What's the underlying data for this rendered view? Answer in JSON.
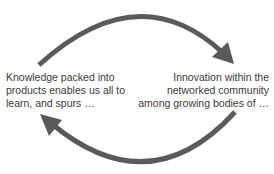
{
  "diagram": {
    "type": "cycle",
    "arrow_color": "#5a5a5a",
    "nodes": [
      {
        "id": "left",
        "lines": [
          "Knowledge packed into",
          "products enables us all to",
          "learn, and spurs  …"
        ]
      },
      {
        "id": "right",
        "lines": [
          "Innovation within the",
          "networked community",
          "among growing bodies of …"
        ]
      }
    ],
    "edges": [
      {
        "from": "left",
        "to": "right",
        "position": "top"
      },
      {
        "from": "right",
        "to": "left",
        "position": "bottom"
      }
    ]
  }
}
